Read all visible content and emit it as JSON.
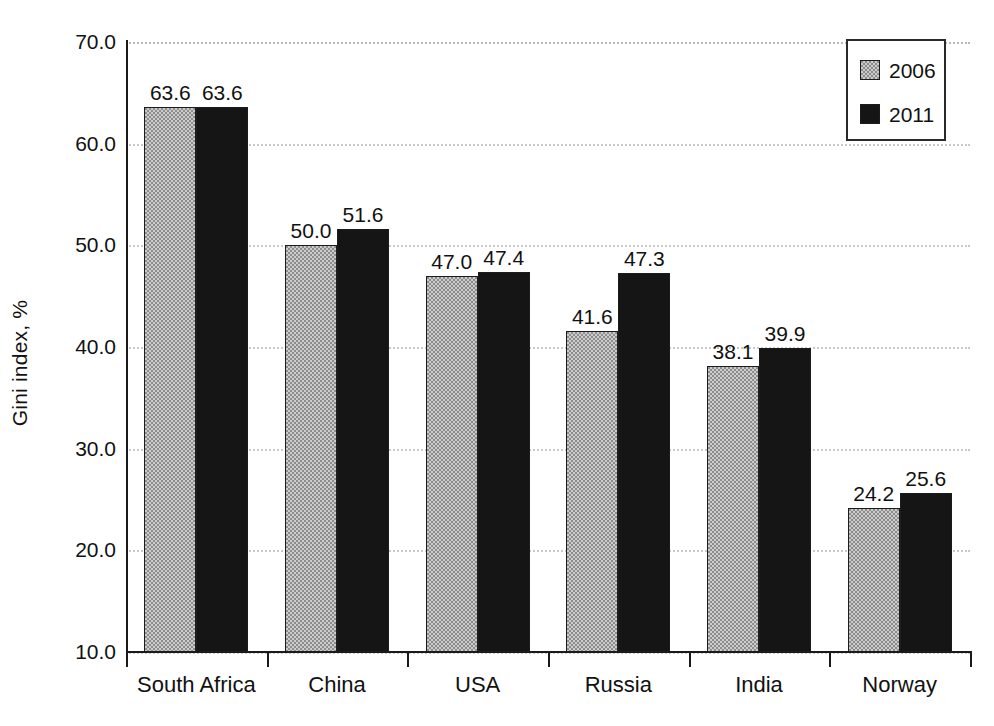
{
  "chart_data": {
    "type": "bar",
    "title": "",
    "xlabel": "",
    "ylabel": "Gini index, %",
    "categories": [
      "South Africa",
      "China",
      "USA",
      "Russia",
      "India",
      "Norway"
    ],
    "series": [
      {
        "name": "2006",
        "color": "#8d8d8d",
        "values": [
          63.6,
          50.0,
          47.0,
          41.6,
          38.1,
          24.2
        ]
      },
      {
        "name": "2011",
        "color": "#151515",
        "values": [
          63.6,
          51.6,
          47.4,
          47.3,
          39.9,
          25.6
        ]
      }
    ],
    "value_labels": [
      [
        "63.6",
        "50.0",
        "47.0",
        "41.6",
        "38.1",
        "24.2"
      ],
      [
        "63.6",
        "51.6",
        "47.4",
        "47.3",
        "39.9",
        "25.6"
      ]
    ],
    "ylim": [
      10.0,
      70.0
    ],
    "ytick_values": [
      10.0,
      20.0,
      30.0,
      40.0,
      50.0,
      60.0,
      70.0
    ],
    "ytick_labels": [
      "10.0",
      "20.0",
      "30.0",
      "40.0",
      "50.0",
      "60.0",
      "70.0"
    ],
    "grid": "horizontal-dotted",
    "legend_position": "top-right",
    "legend_entries": [
      "2006",
      "2011"
    ]
  }
}
